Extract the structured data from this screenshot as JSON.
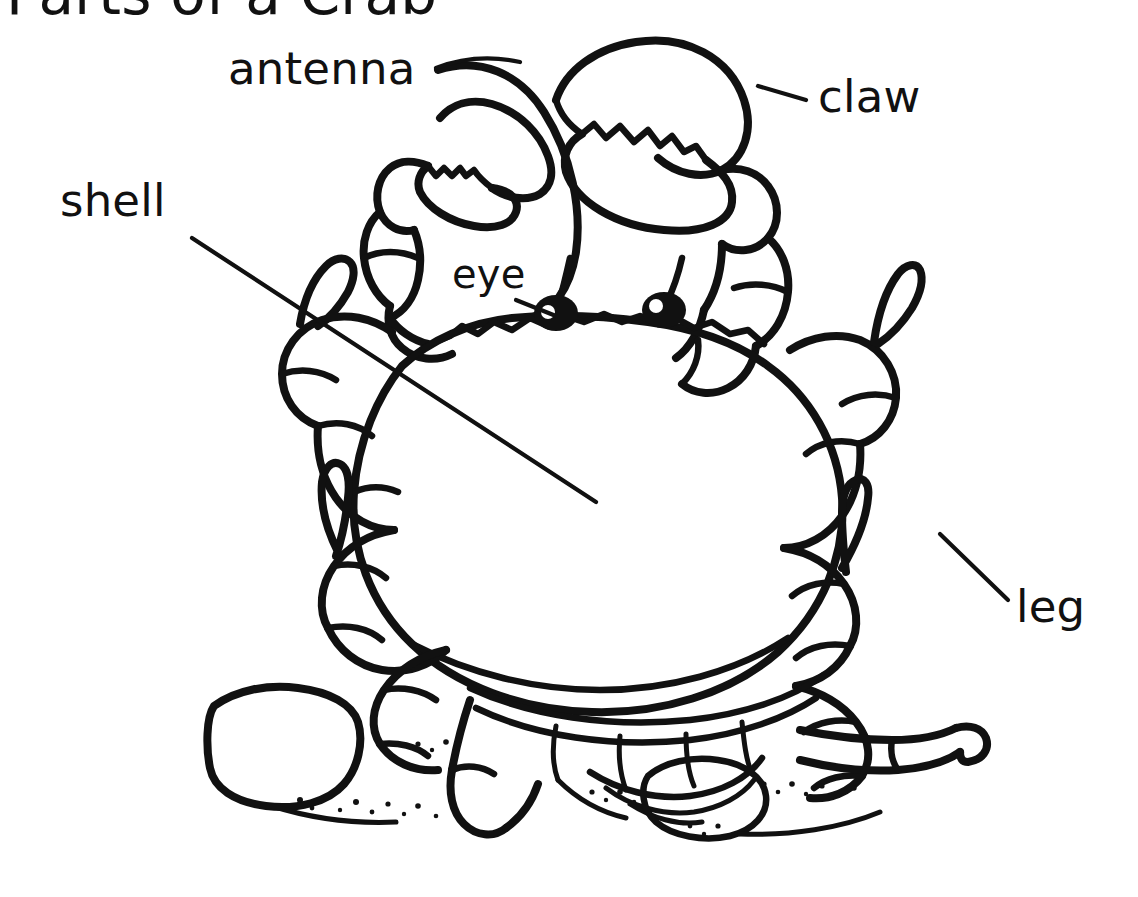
{
  "document": {
    "title": "Parts of a Crab",
    "subject": "crab-anatomy-diagram",
    "style": "black-and-white line drawing",
    "background_color": "#ffffff",
    "ink_color": "#111111"
  },
  "labels": [
    {
      "id": "antenna",
      "text": "antenna",
      "x": 228,
      "y": 84,
      "anchor": "start",
      "leader": true,
      "leader_from": [
        440,
        68
      ],
      "leader_to": [
        600,
        60
      ]
    },
    {
      "id": "claw",
      "text": "claw",
      "x": 818,
      "y": 112,
      "anchor": "start",
      "leader": true,
      "leader_from": [
        758,
        86
      ],
      "leader_to": [
        806,
        100
      ]
    },
    {
      "id": "shell",
      "text": "shell",
      "x": 60,
      "y": 216,
      "anchor": "start",
      "leader": true,
      "leader_from": [
        192,
        238
      ],
      "leader_to": [
        596,
        502
      ]
    },
    {
      "id": "eye",
      "text": "eye",
      "x": 452,
      "y": 288,
      "anchor": "start",
      "leader": true,
      "leader_from": [
        516,
        300
      ],
      "leader_to": [
        556,
        316
      ]
    },
    {
      "id": "leg",
      "text": "leg",
      "x": 1016,
      "y": 622,
      "anchor": "start",
      "leader": true,
      "leader_from": [
        940,
        534
      ],
      "leader_to": [
        1008,
        600
      ]
    }
  ],
  "anatomy_parts": [
    {
      "name": "antenna",
      "count": 1,
      "description": "long thin curving sensory filament between the claws"
    },
    {
      "name": "claw",
      "count": 2,
      "description": "large pincers (chelipeds) with serrated cutting edges"
    },
    {
      "name": "shell",
      "count": 1,
      "description": "broad oval carapace covering the body"
    },
    {
      "name": "eye",
      "count": 2,
      "description": "black stalked eyes with white highlight on the shell front edge"
    },
    {
      "name": "leg",
      "count": 8,
      "description": "jointed walking legs with pointed tips"
    }
  ],
  "scene": {
    "ground": "sand and rocks",
    "rock_count": 2,
    "stipple": "scattered sand grains"
  },
  "colors": {
    "ink": "#111111",
    "paper": "#ffffff"
  }
}
